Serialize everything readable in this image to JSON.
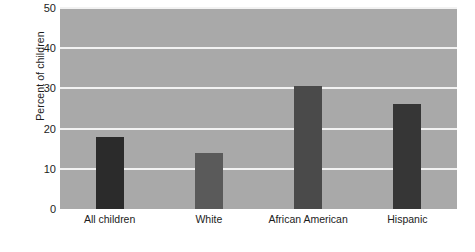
{
  "chart_data": {
    "type": "bar",
    "title": "",
    "xlabel": "",
    "ylabel": "Percent of children",
    "categories": [
      "All children",
      "White",
      "African American",
      "Hispanic"
    ],
    "values": [
      18,
      14,
      30.5,
      26
    ],
    "ylim": [
      0,
      50
    ],
    "yticks": [
      0,
      10,
      20,
      30,
      40,
      50
    ],
    "ytick_labels": [
      "0",
      "10",
      "20",
      "30",
      "40",
      "50"
    ],
    "grid": "horizontal-white-gridlines",
    "legend": "none",
    "bar_colors": [
      "#2b2b2b",
      "#5a5a5a",
      "#4a4a4a",
      "#363636"
    ],
    "plot_background": "#a9a9a9",
    "figure_background": "#ffffff",
    "gridline_color": "#f2f2f2"
  }
}
